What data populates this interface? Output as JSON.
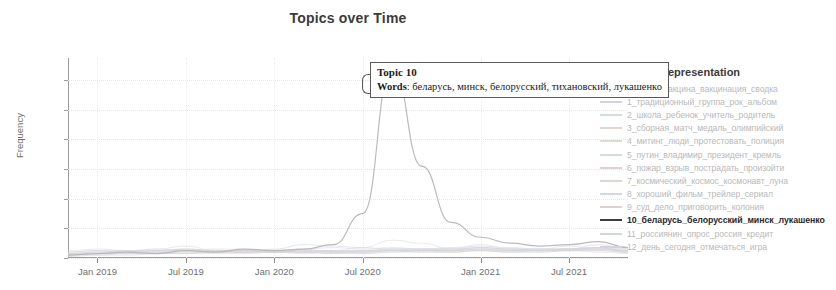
{
  "header": {
    "title": "Topics over Time"
  },
  "axes": {
    "y_title": "Frequency",
    "y_ticks": [
      "0",
      "20",
      "40",
      "60",
      "80",
      "100",
      "120"
    ],
    "x_ticks": [
      "Jan 2019",
      "Jul 2019",
      "Jan 2020",
      "Jul 2020",
      "Jan 2021",
      "Jul 2021"
    ]
  },
  "tooltip": {
    "title": "Topic 10",
    "words_label": "Words",
    "words_value": ": беларусь, минск, белорусский, тихановский, лукашенко"
  },
  "legend": {
    "title": "Representation",
    "items": [
      {
        "label": "0_вирус_вакцина_вакцинация_сводка",
        "color": "#cfd4e0",
        "highlight": false
      },
      {
        "label": "1_традиционный_группа_рок_альбом",
        "color": "#d6cfe0",
        "highlight": false
      },
      {
        "label": "2_школа_ребенок_учитель_родитель",
        "color": "#cfe0d6",
        "highlight": false
      },
      {
        "label": "3_сборная_матч_медаль_олимпийский",
        "color": "#e0d6cf",
        "highlight": false
      },
      {
        "label": "4_митинг_люди_протестовать_полиция",
        "color": "#d9dccf",
        "highlight": false
      },
      {
        "label": "5_путин_владимир_президент_кремль",
        "color": "#cfdce0",
        "highlight": false
      },
      {
        "label": "6_пожар_взрыв_пострадать_произойти",
        "color": "#e0cfd9",
        "highlight": false
      },
      {
        "label": "7_космический_космос_космонавт_луна",
        "color": "#d2dccf",
        "highlight": false
      },
      {
        "label": "8_хороший_фильм_трейлер_сериал",
        "color": "#cfd9e0",
        "highlight": false
      },
      {
        "label": "9_суд_дело_приговорить_колония",
        "color": "#ddd2cf",
        "highlight": false
      },
      {
        "label": "10_беларусь_белорусский_минск_лукашенко",
        "color": "#3d3d3d",
        "highlight": true
      },
      {
        "label": "11_россиянин_опрос_россия_кредит",
        "color": "#cfd6e0",
        "highlight": false
      },
      {
        "label": "12_день_сегодня_отмечаться_игра",
        "color": "#d8cfe0",
        "highlight": false
      }
    ]
  },
  "chart_data": {
    "type": "line",
    "title": "Topics over Time",
    "xlabel": "",
    "ylabel": "Frequency",
    "ylim": [
      0,
      135
    ],
    "grid": true,
    "legend_position": "right",
    "x": [
      "Nov 2018",
      "Jan 2019",
      "Mar 2019",
      "May 2019",
      "Jul 2019",
      "Sep 2019",
      "Nov 2019",
      "Jan 2020",
      "Mar 2020",
      "May 2020",
      "Jul 2020",
      "Aug 2020",
      "Sep 2020",
      "Nov 2020",
      "Jan 2021",
      "Mar 2021",
      "May 2021",
      "Jul 2021",
      "Sep 2021",
      "Nov 2021"
    ],
    "series": [
      {
        "name": "10_беларусь_белорусский_минск_лукашенко",
        "values": [
          2,
          3,
          4,
          3,
          5,
          4,
          6,
          5,
          6,
          9,
          30,
          131,
          62,
          24,
          14,
          10,
          8,
          9,
          11,
          7
        ]
      },
      {
        "name": "0_вирус_вакцина_вакцинация_сводка",
        "values": [
          1,
          2,
          2,
          3,
          3,
          4,
          4,
          6,
          9,
          8,
          7,
          6,
          6,
          7,
          8,
          7,
          6,
          6,
          9,
          6
        ]
      },
      {
        "name": "1_традиционный_группа_рок_альбом",
        "values": [
          3,
          4,
          5,
          4,
          6,
          5,
          5,
          4,
          5,
          4,
          4,
          5,
          5,
          5,
          6,
          5,
          5,
          6,
          7,
          5
        ]
      },
      {
        "name": "2_школа_ребенок_учитель_родитель",
        "values": [
          2,
          3,
          3,
          4,
          3,
          5,
          4,
          4,
          6,
          4,
          3,
          4,
          5,
          6,
          5,
          4,
          4,
          5,
          7,
          4
        ]
      },
      {
        "name": "3_сборная_матч_медаль_олимпийский",
        "values": [
          4,
          5,
          4,
          5,
          6,
          4,
          4,
          5,
          4,
          3,
          4,
          5,
          5,
          4,
          5,
          5,
          6,
          8,
          6,
          5
        ]
      },
      {
        "name": "4_митинг_люди_протестовать_полиция",
        "values": [
          2,
          3,
          4,
          6,
          8,
          5,
          4,
          4,
          4,
          5,
          7,
          12,
          10,
          6,
          9,
          6,
          5,
          5,
          6,
          5
        ]
      },
      {
        "name": "5_путин_владимир_президент_кремль",
        "values": [
          5,
          6,
          5,
          6,
          5,
          6,
          6,
          5,
          6,
          7,
          6,
          7,
          6,
          6,
          7,
          6,
          6,
          6,
          7,
          6
        ]
      },
      {
        "name": "6_пожар_взрыв_пострадать_произойти",
        "values": [
          3,
          4,
          4,
          4,
          5,
          4,
          4,
          4,
          4,
          4,
          5,
          5,
          4,
          4,
          5,
          4,
          5,
          6,
          5,
          4
        ]
      },
      {
        "name": "7_космический_космос_космонавт_луна",
        "values": [
          2,
          2,
          3,
          3,
          3,
          3,
          3,
          4,
          3,
          3,
          3,
          4,
          4,
          4,
          5,
          4,
          4,
          5,
          4,
          3
        ]
      },
      {
        "name": "8_хороший_фильм_трейлер_сериал",
        "values": [
          3,
          4,
          4,
          5,
          5,
          4,
          5,
          5,
          4,
          4,
          4,
          5,
          5,
          5,
          6,
          5,
          5,
          6,
          6,
          5
        ]
      },
      {
        "name": "9_суд_дело_приговорить_колония",
        "values": [
          2,
          3,
          3,
          3,
          4,
          4,
          4,
          4,
          4,
          4,
          5,
          6,
          6,
          5,
          7,
          6,
          5,
          5,
          5,
          4
        ]
      },
      {
        "name": "11_россиянин_опрос_россия_кредит",
        "values": [
          3,
          3,
          4,
          4,
          4,
          4,
          5,
          4,
          5,
          5,
          4,
          5,
          5,
          5,
          6,
          5,
          5,
          5,
          6,
          4
        ]
      },
      {
        "name": "12_день_сегодня_отмечаться_игра",
        "values": [
          4,
          5,
          5,
          5,
          6,
          5,
          5,
          5,
          5,
          5,
          5,
          6,
          6,
          6,
          7,
          6,
          6,
          6,
          7,
          5
        ]
      }
    ]
  }
}
